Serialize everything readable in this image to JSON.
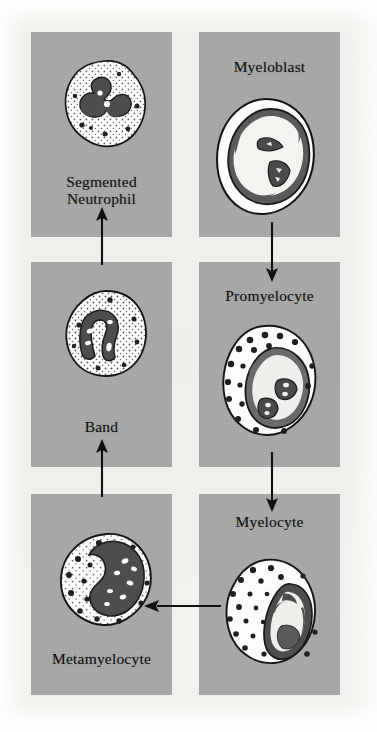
{
  "diagram": {
    "background_color": "#f1f0ec",
    "panel_color": "#a9a9a9",
    "ink_color": "#111111",
    "cytoplasm_color": "#fdfdfb",
    "nucleus_color": "#4a4a4a",
    "granule_color": "#2b2b2b"
  },
  "panels": [
    {
      "id": "segmented-neutrophil",
      "label": "Segmented\nNeutrophil",
      "column": "left",
      "row": 1,
      "cell_type": "segmented-neutrophil",
      "cell_description": "Round cell with pale granular cytoplasm and a multi-lobed dark nucleus joined by thin filaments"
    },
    {
      "id": "myeloblast",
      "label": "Myeloblast",
      "column": "right",
      "row": 1,
      "cell_type": "myeloblast",
      "cell_description": "Large oval cell with thin rim of cytoplasm and a very large nucleus containing two nucleoli"
    },
    {
      "id": "band",
      "label": "Band",
      "column": "left",
      "row": 2,
      "cell_type": "band",
      "cell_description": "Round cell with finely stippled cytoplasm and a horseshoe / band shaped dark nucleus"
    },
    {
      "id": "promyelocyte",
      "label": "Promyelocyte",
      "column": "right",
      "row": 2,
      "cell_type": "promyelocyte",
      "cell_description": "Oval cell with prominent dark primary granules and a large eccentric nucleus with nucleoli"
    },
    {
      "id": "metamyelocyte",
      "label": "Metamyelocyte",
      "column": "left",
      "row": 3,
      "cell_type": "metamyelocyte",
      "cell_description": "Round cell with stippled cytoplasm and a kidney / bean shaped indented dark nucleus"
    },
    {
      "id": "myelocyte",
      "label": "Myelocyte",
      "column": "right",
      "row": 3,
      "cell_type": "myelocyte",
      "cell_description": "Round cell with many dark granules and an oval eccentric nucleus pushed to one side"
    }
  ],
  "arrows": [
    {
      "id": "myeloblast-to-promyelocyte",
      "from": "myeloblast",
      "to": "promyelocyte",
      "direction": "down"
    },
    {
      "id": "promyelocyte-to-myelocyte",
      "from": "promyelocyte",
      "to": "myelocyte",
      "direction": "down"
    },
    {
      "id": "myelocyte-to-metamyelocyte",
      "from": "myelocyte",
      "to": "metamyelocyte",
      "direction": "left"
    },
    {
      "id": "metamyelocyte-to-band",
      "from": "metamyelocyte",
      "to": "band",
      "direction": "up"
    },
    {
      "id": "band-to-segmented-neutrophil",
      "from": "band",
      "to": "segmented-neutrophil",
      "direction": "up"
    }
  ],
  "sequence": [
    "Myeloblast",
    "Promyelocyte",
    "Myelocyte",
    "Metamyelocyte",
    "Band",
    "Segmented Neutrophil"
  ]
}
